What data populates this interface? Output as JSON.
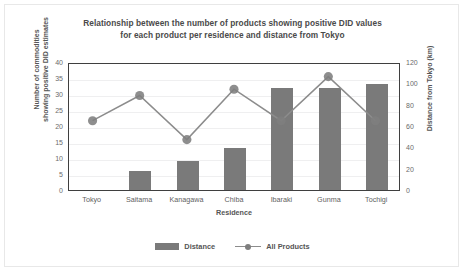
{
  "chart_data": {
    "type": "bar",
    "title": "Relationship between the number of products showing positive DID values for each product per residence and distance from Tokyo",
    "title_lines": [
      "Relationship between the number of products showing positive DID values",
      "for each product per residence and distance from Tokyo"
    ],
    "categories": [
      "Tokyo",
      "Saitama",
      "Kanagawa",
      "Chiba",
      "Ibaraki",
      "Gunma",
      "Tochigi"
    ],
    "xlabel": "Residence",
    "ylabel": "Number of commodities showing positive DID estimates",
    "ylabel_lines": [
      "Number of commodities",
      "showing positive DID estimates"
    ],
    "ylabel_secondary": "Distance from Tokyo (km)",
    "ylim": [
      0,
      40
    ],
    "yticks": [
      0,
      5,
      10,
      15,
      20,
      25,
      30,
      35,
      40
    ],
    "ylim_secondary": [
      0,
      120
    ],
    "yticks_secondary": [
      0,
      20,
      40,
      60,
      80,
      100,
      120
    ],
    "grid": true,
    "legend_position": "bottom",
    "series": [
      {
        "name": "Distance",
        "type": "bar",
        "axis": "secondary",
        "unit": "km",
        "values": [
          0,
          18,
          27,
          39,
          96,
          96,
          99
        ]
      },
      {
        "name": "All Products",
        "type": "line",
        "axis": "primary",
        "values": [
          22,
          30,
          16,
          32,
          22,
          36,
          22
        ]
      }
    ],
    "colors": {
      "bar": "#7a7a7a",
      "line": "#8c8c8c",
      "marker": "#7e7e7e",
      "grid": "#efeff0",
      "axis": "#3f3f3f",
      "text": "#595959",
      "frame": "#e8e8e8",
      "background": "#ffffff"
    }
  },
  "legend": {
    "items": [
      {
        "label": "Distance"
      },
      {
        "label": "All Products"
      }
    ]
  }
}
